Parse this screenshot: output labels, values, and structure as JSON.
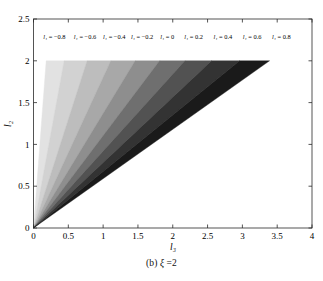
{
  "caption": {
    "prefix": "(b)",
    "symbol": "ξ",
    "equals_value": "=2",
    "full": "(b) ξ =2"
  },
  "chart_data": {
    "type": "area",
    "title": "",
    "subtitle": "",
    "xlabel": "l₃",
    "ylabel": "l₂",
    "xlim": [
      0,
      4
    ],
    "ylim": [
      0,
      2.5
    ],
    "xticks": [
      "0",
      "0.5",
      "1",
      "1.5",
      "2",
      "2.5",
      "3",
      "3.5",
      "4"
    ],
    "xtick_values": [
      0,
      0.5,
      1,
      1.5,
      2,
      2.5,
      3,
      3.5,
      4
    ],
    "yticks": [
      "0",
      "0.5",
      "1",
      "1.5",
      "2",
      "2.5"
    ],
    "ytick_values": [
      0,
      0.5,
      1,
      1.5,
      2,
      2.5
    ],
    "grid": false,
    "legend": "none",
    "annotations_position": "top-inside",
    "series": [
      {
        "name": "l1 = -0.8",
        "label": "l₁ = −0.8",
        "label_x": 0.3,
        "color": "#e2e2e2",
        "apex": [
          0,
          0
        ],
        "upper_slope": 11.0,
        "lower_slope": 4.55,
        "top_y": 2.0,
        "top_x_left": 0.182,
        "top_x_right": 0.44
      },
      {
        "name": "l1 = -0.6",
        "label": "l₁ = −0.6",
        "label_x": 0.74,
        "color": "#d2d2d2",
        "apex": [
          0,
          0
        ],
        "upper_slope": 4.55,
        "lower_slope": 2.6,
        "top_y": 2.0,
        "top_x_left": 0.44,
        "top_x_right": 0.77
      },
      {
        "name": "l1 = -0.4",
        "label": "l₁ = −0.4",
        "label_x": 1.16,
        "color": "#bdbdbd",
        "apex": [
          0,
          0
        ],
        "upper_slope": 2.6,
        "lower_slope": 1.8,
        "top_y": 2.0,
        "top_x_left": 0.77,
        "top_x_right": 1.11
      },
      {
        "name": "l1 = -0.2",
        "label": "l₁ = −0.2",
        "label_x": 1.56,
        "color": "#a8a8a8",
        "apex": [
          0,
          0
        ],
        "upper_slope": 1.8,
        "lower_slope": 1.37,
        "top_y": 2.0,
        "top_x_left": 1.11,
        "top_x_right": 1.46
      },
      {
        "name": "l1 = 0",
        "label": "l₁ = 0",
        "label_x": 1.92,
        "color": "#8e8e8e",
        "apex": [
          0,
          0
        ],
        "upper_slope": 1.37,
        "lower_slope": 1.105,
        "top_y": 2.0,
        "top_x_left": 1.46,
        "top_x_right": 1.81
      },
      {
        "name": "l1 = 0.2",
        "label": "l₁ = 0.2",
        "label_x": 2.3,
        "color": "#6f6f6f",
        "apex": [
          0,
          0
        ],
        "upper_slope": 1.105,
        "lower_slope": 0.92,
        "top_y": 2.0,
        "top_x_left": 1.81,
        "top_x_right": 2.174
      },
      {
        "name": "l1 = 0.4",
        "label": "l₁ = 0.4",
        "label_x": 2.72,
        "color": "#525252",
        "apex": [
          0,
          0
        ],
        "upper_slope": 0.92,
        "lower_slope": 0.782,
        "top_y": 2.0,
        "top_x_left": 2.174,
        "top_x_right": 2.558
      },
      {
        "name": "l1 = 0.6",
        "label": "l₁ = 0.6",
        "label_x": 3.14,
        "color": "#333333",
        "apex": [
          0,
          0
        ],
        "upper_slope": 0.782,
        "lower_slope": 0.676,
        "top_y": 2.0,
        "top_x_left": 2.558,
        "top_x_right": 2.96
      },
      {
        "name": "l1 = 0.8",
        "label": "l₁ = 0.8",
        "label_x": 3.56,
        "color": "#1a1a1a",
        "apex": [
          0,
          0
        ],
        "upper_slope": 0.676,
        "lower_slope": 0.59,
        "top_y": 2.0,
        "top_x_left": 2.96,
        "top_x_right": 3.39
      }
    ]
  }
}
